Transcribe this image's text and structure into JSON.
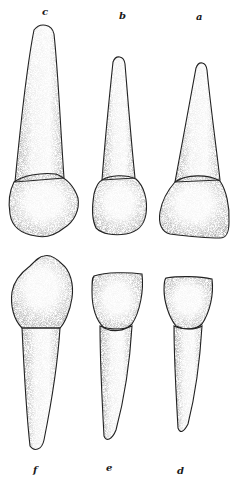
{
  "figure": {
    "type": "anatomical-illustration",
    "ink_color": "#1a1a1a",
    "paper_color": "#ffffff",
    "labels": {
      "c": "c",
      "b": "b",
      "a": "a",
      "f": "f",
      "e": "e",
      "d": "d"
    },
    "top_row": [
      "c",
      "b",
      "a"
    ],
    "bottom_row": [
      "f",
      "e",
      "d"
    ]
  }
}
